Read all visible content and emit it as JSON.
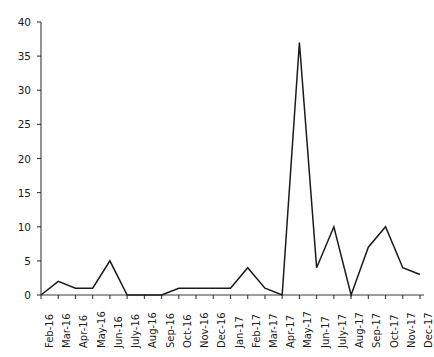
{
  "chart_data": {
    "type": "line",
    "title": "",
    "subtitle": "",
    "xlabel": "",
    "ylabel": "",
    "categories": [
      "Feb-16",
      "Mar-16",
      "Apr-16",
      "May-16",
      "Jun-16",
      "July-16",
      "Aug-16",
      "Sep-16",
      "Oct-16",
      "Nov-16",
      "Dec-16",
      "Jan-17",
      "Feb-17",
      "Mar-17",
      "Apr-17",
      "May-17",
      "Jun-17",
      "July-17",
      "Aug-17",
      "Sep-17",
      "Oct-17",
      "Nov-17",
      "Dec-17"
    ],
    "values": [
      0,
      2,
      1,
      1,
      5,
      0,
      0,
      0,
      1,
      1,
      1,
      1,
      4,
      1,
      0,
      37,
      4,
      10,
      0,
      7,
      10,
      4,
      3
    ],
    "series": [
      {
        "name": "",
        "values": [
          0,
          2,
          1,
          1,
          5,
          0,
          0,
          0,
          1,
          1,
          1,
          1,
          4,
          1,
          0,
          37,
          4,
          10,
          0,
          7,
          10,
          4,
          3
        ]
      }
    ],
    "ylim": [
      0,
      40
    ],
    "yticks": [
      0,
      5,
      10,
      15,
      20,
      25,
      30,
      35,
      40
    ],
    "ytick_labels": [
      "0",
      "5",
      "10",
      "15",
      "20",
      "25",
      "30",
      "35",
      "40"
    ],
    "grid": false,
    "legend": "none",
    "line_color": "#1a1a1a",
    "axis_color": "#3a3a3a",
    "background": "#ffffff"
  }
}
